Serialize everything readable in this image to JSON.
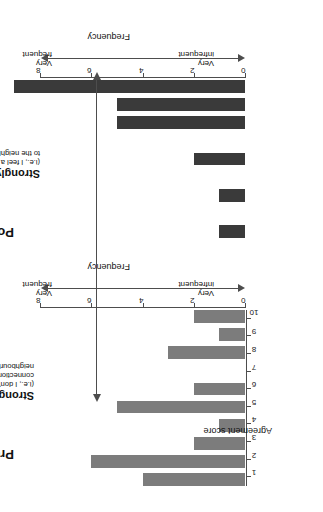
{
  "figure": {
    "axis_title_x": "Agreement score",
    "axis_title_y": "Frequency"
  },
  "annotations": {
    "disagree": {
      "headline": "Strongly disagree",
      "line1": "(i.e., I don't feel a",
      "line2": "connection to the",
      "line3": "neighbourhood)"
    },
    "agree": {
      "headline": "Strongly agree",
      "line1": "(i.e., I feel a connection",
      "line2": "to the neighborhood)"
    },
    "frequency_low": {
      "line1": "Very",
      "line2": "infrequent"
    },
    "frequency_high": {
      "line1": "Very",
      "line2": "frequent"
    }
  },
  "chart_data": [
    {
      "type": "bar",
      "title": "Pre-internship",
      "xlabel": "Agreement score",
      "ylabel": "Frequency",
      "categories": [
        "1",
        "2",
        "3",
        "4",
        "5",
        "6",
        "7",
        "8",
        "9",
        "10"
      ],
      "values": [
        4,
        6,
        2,
        1,
        5,
        2,
        0,
        3,
        1,
        2
      ],
      "ylim": [
        0,
        8
      ],
      "yticks": [
        "0",
        "2",
        "4",
        "6",
        "8"
      ],
      "bar_color": "#7c7c7c",
      "grid": false,
      "legend": "none"
    },
    {
      "type": "bar",
      "title": "Post-internship",
      "xlabel": "Agreement score",
      "ylabel": "Frequency",
      "categories": [
        "1",
        "2",
        "3",
        "4",
        "5",
        "6",
        "7",
        "8",
        "9",
        "10"
      ],
      "values": [
        0,
        1,
        0,
        1,
        0,
        2,
        0,
        5,
        5,
        9
      ],
      "ylim": [
        0,
        8
      ],
      "yticks": [
        "0",
        "2",
        "4",
        "6",
        "8"
      ],
      "bar_color": "#3a3a3a",
      "grid": false,
      "legend": "none"
    }
  ]
}
